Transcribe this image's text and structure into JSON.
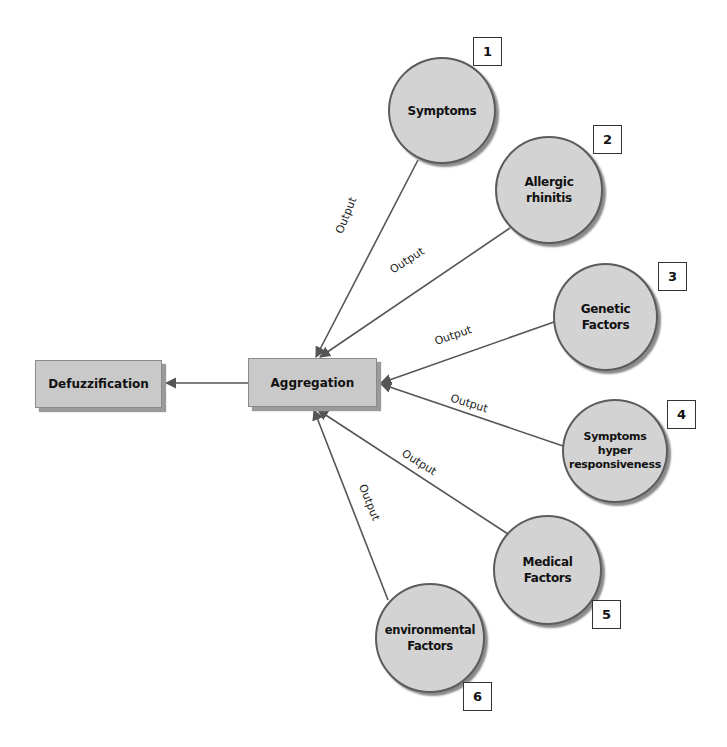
{
  "diagram": {
    "type": "fuzzy-inference-flow",
    "colors": {
      "node_fill": "#d3d3d3",
      "rect_fill": "#c9c9c9",
      "edge": "#555555"
    },
    "process_nodes": [
      {
        "id": "defuzzification",
        "label": "Defuzzification"
      },
      {
        "id": "aggregation",
        "label": "Aggregation"
      }
    ],
    "input_nodes": [
      {
        "id": "symptoms",
        "label": "Symptoms",
        "number": "1"
      },
      {
        "id": "allergic-rhinitis",
        "label": "Allergic\nrhinitis",
        "number": "2"
      },
      {
        "id": "genetic-factors",
        "label": "Genetic\nFactors",
        "number": "3"
      },
      {
        "id": "symptoms-hyper",
        "label": "Symptoms\nhyper\nresponsiveness",
        "number": "4"
      },
      {
        "id": "medical-factors",
        "label": "Medical\nFactors",
        "number": "5"
      },
      {
        "id": "environmental-factors",
        "label": "environmental\nFactors",
        "number": "6"
      }
    ],
    "edge_labels": [
      "Output",
      "Output",
      "Output",
      "Output",
      "Output",
      "Output"
    ],
    "edges": [
      {
        "from": "symptoms",
        "to": "aggregation",
        "label": "Output"
      },
      {
        "from": "allergic-rhinitis",
        "to": "aggregation",
        "label": "Output"
      },
      {
        "from": "genetic-factors",
        "to": "aggregation",
        "label": "Output"
      },
      {
        "from": "symptoms-hyper",
        "to": "aggregation",
        "label": "Output"
      },
      {
        "from": "medical-factors",
        "to": "aggregation",
        "label": "Output"
      },
      {
        "from": "environmental-factors",
        "to": "aggregation",
        "label": "Output"
      },
      {
        "from": "aggregation",
        "to": "defuzzification",
        "label": ""
      }
    ]
  }
}
